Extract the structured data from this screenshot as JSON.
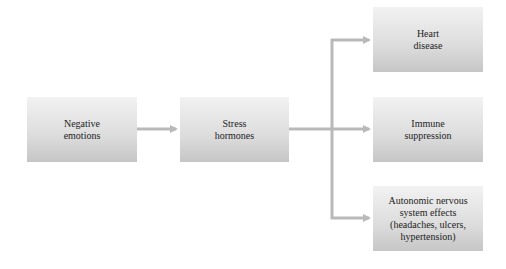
{
  "diagram": {
    "nodes": [
      {
        "id": "negative-emotions",
        "label": "Negative\nemotions"
      },
      {
        "id": "stress-hormones",
        "label": "Stress\nhormones"
      },
      {
        "id": "heart-disease",
        "label": "Heart\ndisease"
      },
      {
        "id": "immune-suppression",
        "label": "Immune\nsuppression"
      },
      {
        "id": "autonomic-effects",
        "label": "Autonomic nervous\nsystem effects\n(headaches, ulcers,\nhypertension)"
      }
    ],
    "edges": [
      {
        "from": "negative-emotions",
        "to": "stress-hormones"
      },
      {
        "from": "stress-hormones",
        "to": "heart-disease"
      },
      {
        "from": "stress-hormones",
        "to": "immune-suppression"
      },
      {
        "from": "stress-hormones",
        "to": "autonomic-effects"
      }
    ],
    "colors": {
      "arrow": "#b9b9b9",
      "box_top": "#f2f2f2",
      "box_bottom": "#c6c6c6",
      "text": "#222222"
    }
  }
}
